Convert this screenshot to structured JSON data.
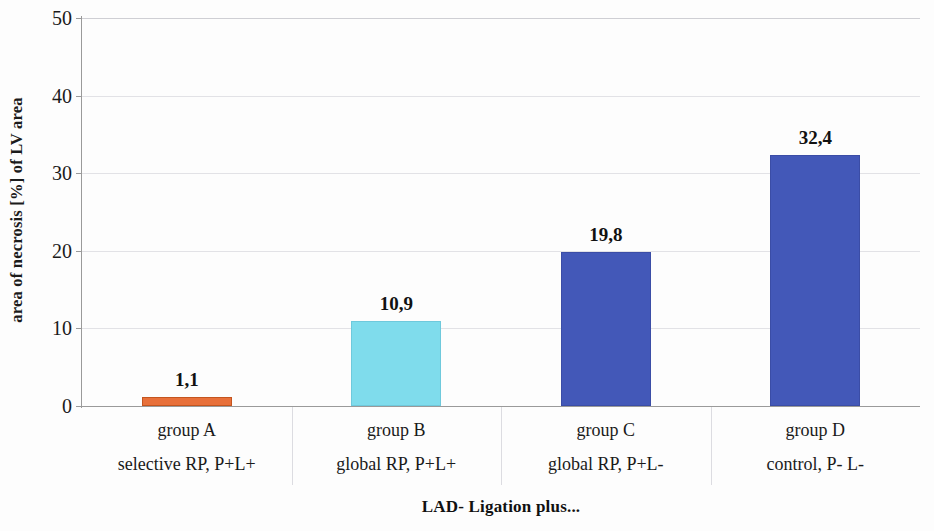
{
  "chart_data": {
    "type": "bar",
    "title": "",
    "xlabel": "LAD- Ligation plus...",
    "ylabel": "area of necrosis [%] of LV area",
    "categories": [
      "group A",
      "group B",
      "group C",
      "group D"
    ],
    "category_sublabels": [
      "selective RP, P+L+",
      "global RP, P+L+",
      "global RP, P+L-",
      "control, P- L-"
    ],
    "values": [
      1.1,
      10.9,
      19.8,
      32.4
    ],
    "value_labels": [
      "1,1",
      "10,9",
      "19,8",
      "32,4"
    ],
    "bar_colors": [
      "#E8703A",
      "#7FDCEC",
      "#4358B8",
      "#4358B8"
    ],
    "bar_border_colors": [
      "#C4551F",
      "#6FC9DC",
      "#3B4DA6",
      "#3B4DA6"
    ],
    "ylim": [
      0,
      50
    ],
    "ytick_labels": [
      "50",
      "40",
      "30",
      "20",
      "10",
      "0"
    ],
    "ytick_values": [
      50,
      40,
      30,
      20,
      10,
      0
    ],
    "grid": "horizontal",
    "legend": "none",
    "decimal_separator": ","
  },
  "axis": {
    "y_title": "area of necrosis [%] of LV area",
    "x_title": "LAD- Ligation plus..."
  },
  "colors": {
    "gridline": "#e2e2e6",
    "axis_line": "#9a9a9a",
    "background": "#fdfdfd",
    "text": "#1a1a1a"
  }
}
